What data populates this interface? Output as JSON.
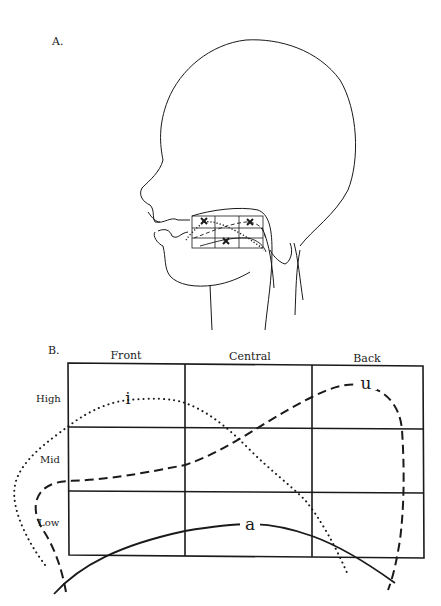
{
  "panels": {
    "a": {
      "label": "A.",
      "description": "Head profile with vowel grid over the tongue",
      "markers": [
        "x",
        "x",
        "x"
      ]
    },
    "b": {
      "label": "B.",
      "columns": [
        "Front",
        "Central",
        "Back"
      ],
      "rows": [
        "High",
        "Mid",
        "Low"
      ],
      "vowels": [
        {
          "symbol": "i",
          "line_style": "dotted"
        },
        {
          "symbol": "u",
          "line_style": "dashed"
        },
        {
          "symbol": "a",
          "line_style": "solid"
        }
      ]
    }
  },
  "colors": {
    "ink": "#1a1a1a",
    "background": "#ffffff"
  }
}
